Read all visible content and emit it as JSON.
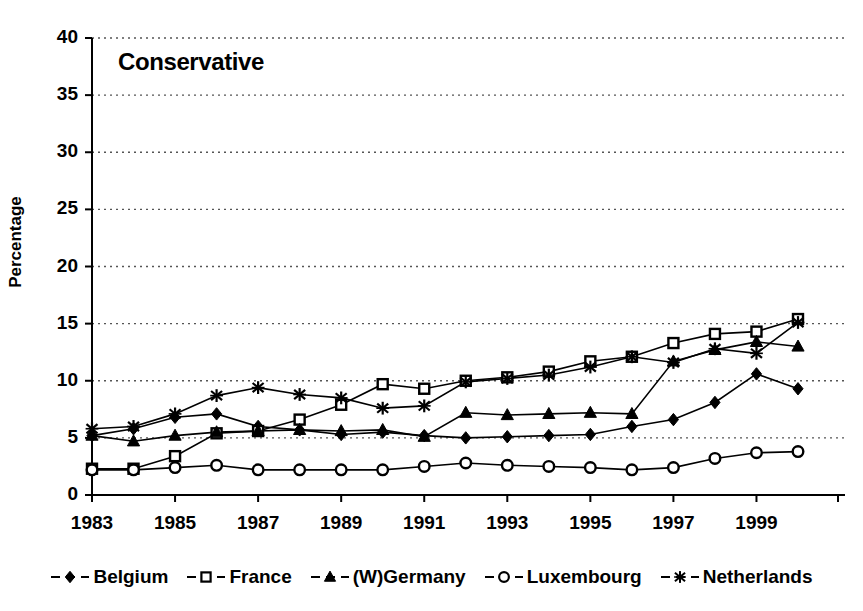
{
  "chart_data": {
    "type": "line",
    "title": "Conservative",
    "xlabel": "",
    "ylabel": "Percentage",
    "ylim": [
      0,
      40
    ],
    "ytick_values": [
      0,
      5,
      10,
      15,
      20,
      25,
      30,
      35,
      40
    ],
    "xlim": [
      1983,
      2000
    ],
    "xtick_labels": [
      "1983",
      "1985",
      "1987",
      "1989",
      "1991",
      "1993",
      "1995",
      "1997",
      "1999"
    ],
    "xtick_values": [
      1983,
      1985,
      1987,
      1989,
      1991,
      1993,
      1995,
      1997,
      1999
    ],
    "x": [
      1983,
      1984,
      1985,
      1986,
      1987,
      1988,
      1989,
      1990,
      1991,
      1992,
      1993,
      1994,
      1995,
      1996,
      1997,
      1998,
      1999,
      2000
    ],
    "grid": "horizontal-dotted",
    "legend_position": "bottom",
    "series": [
      {
        "name": "Belgium",
        "marker": "filled-diamond",
        "values": [
          5.2,
          5.8,
          6.8,
          7.1,
          6.0,
          5.7,
          5.3,
          5.5,
          5.2,
          5.0,
          5.1,
          5.2,
          5.3,
          6.0,
          6.6,
          8.1,
          10.6,
          9.3
        ]
      },
      {
        "name": "France",
        "marker": "open-square",
        "values": [
          2.3,
          2.3,
          3.4,
          5.4,
          5.6,
          6.6,
          7.9,
          9.7,
          9.3,
          10.0,
          10.3,
          10.8,
          11.7,
          12.1,
          13.3,
          14.1,
          14.3,
          15.4
        ]
      },
      {
        "name": "(W)Germany",
        "marker": "filled-triangle",
        "values": [
          5.2,
          4.7,
          5.2,
          5.5,
          5.6,
          5.7,
          5.6,
          5.7,
          5.1,
          7.2,
          7.0,
          7.1,
          7.2,
          7.1,
          11.7,
          12.7,
          13.4,
          13.0
        ]
      },
      {
        "name": "Luxembourg",
        "marker": "open-circle",
        "values": [
          2.2,
          2.2,
          2.4,
          2.6,
          2.2,
          2.2,
          2.2,
          2.2,
          2.5,
          2.8,
          2.6,
          2.5,
          2.4,
          2.2,
          2.4,
          3.2,
          3.7,
          3.8
        ]
      },
      {
        "name": "Netherlands",
        "marker": "filled-star",
        "values": [
          5.8,
          6.0,
          7.1,
          8.7,
          9.4,
          8.8,
          8.5,
          7.6,
          7.8,
          9.9,
          10.2,
          10.5,
          11.2,
          12.1,
          11.6,
          12.8,
          12.4,
          15.1
        ]
      }
    ]
  },
  "legend": {
    "items": [
      {
        "label": "Belgium",
        "marker": "filled-diamond"
      },
      {
        "label": "France",
        "marker": "open-square"
      },
      {
        "label": "(W)Germany",
        "marker": "filled-triangle"
      },
      {
        "label": "Luxembourg",
        "marker": "open-circle"
      },
      {
        "label": "Netherlands",
        "marker": "filled-star"
      }
    ]
  },
  "colors": {
    "ink": "#000000",
    "background": "#ffffff",
    "grid": "#555555"
  }
}
